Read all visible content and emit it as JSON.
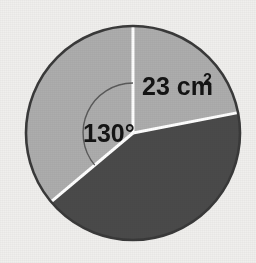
{
  "figure": {
    "background_color": "#f0efed"
  },
  "chart_data": {
    "type": "pie",
    "title": "",
    "xlabel": "",
    "ylabel": "",
    "legend_position": "none",
    "grid": false,
    "center": {
      "x": 133,
      "y": 133
    },
    "radius": 107,
    "outline_color": "#3a3a3a",
    "divider_color": "#ffffff",
    "categories": [
      "light-sector-left",
      "light-sector-upper-right",
      "dark-sector-lower-right"
    ],
    "values": [
      130,
      101,
      129
    ],
    "value_unit": "degrees",
    "colors": [
      "#adadad",
      "#adadad",
      "#4a4a4a"
    ],
    "slices": [
      {
        "name": "light-sector-left",
        "fill": "#adadad",
        "start_angle_deg": 270,
        "end_angle_deg": 40,
        "sweep_deg": 130,
        "label": "130°"
      },
      {
        "name": "light-sector-upper-right",
        "fill": "#adadad",
        "start_angle_deg": 270,
        "end_angle_deg": 349,
        "sweep_deg": 101,
        "label": "23 cm²"
      },
      {
        "name": "dark-sector-lower-right",
        "fill": "#4a4a4a",
        "start_angle_deg": 349,
        "end_angle_deg": 140,
        "sweep_deg": 129,
        "label": ""
      }
    ],
    "annotations": [
      {
        "name": "angle-label",
        "text": "130°",
        "value": 130,
        "unit": "degrees",
        "x": 83,
        "y": 142
      },
      {
        "name": "area-label",
        "text": "23 cm²",
        "value": 23,
        "unit": "cm^2",
        "base_text": "23 cm",
        "superscript": "2",
        "x": 142,
        "y": 95
      }
    ],
    "angle_arc": {
      "name": "angle-arc",
      "radius": 50,
      "color": "#5a5a5a",
      "start_angle_deg": 270,
      "end_angle_deg": 220
    }
  },
  "labels": {
    "angle": "130°",
    "area_base": "23 cm",
    "area_superscript": "2"
  }
}
